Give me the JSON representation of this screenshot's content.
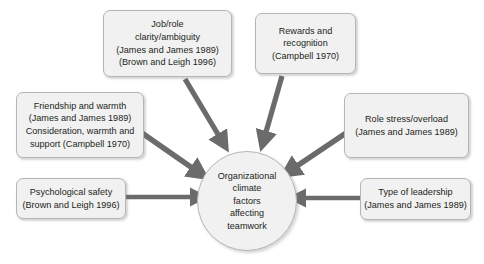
{
  "diagram": {
    "title": "Organizational climate factors affecting teamwork",
    "type": "radial-influence-diagram",
    "colors": {
      "box_fill": "#f1f1f1",
      "box_border": "#b5b5b5",
      "arrow": "#6b6b6b",
      "text": "#231f20",
      "background": "#ffffff"
    },
    "center": {
      "shape": "circle",
      "lines": [
        "Organizational",
        "climate",
        "factors",
        "affecting",
        "teamwork"
      ]
    },
    "nodes": [
      {
        "id": "job-role",
        "position": "top-left",
        "lines": [
          "Job/role",
          "clarity/ambiguity",
          "(James and James 1989)",
          "(Brown and Leigh 1996)"
        ]
      },
      {
        "id": "rewards",
        "position": "top-right",
        "lines": [
          "Rewards and",
          "recognition",
          "(Campbell 1970)"
        ]
      },
      {
        "id": "friendship",
        "position": "middle-left",
        "lines": [
          "Friendship and warmth",
          "(James and James 1989)",
          "Consideration, warmth and",
          "support (Campbell 1970)"
        ]
      },
      {
        "id": "role-stress",
        "position": "middle-right",
        "lines": [
          "Role stress/overload",
          "(James and James 1989)"
        ]
      },
      {
        "id": "psych-safety",
        "position": "bottom-left",
        "lines": [
          "Psychological safety",
          "(Brown and Leigh 1996)"
        ]
      },
      {
        "id": "leadership",
        "position": "bottom-right",
        "lines": [
          "Type of leadership",
          "(James and James 1989)"
        ]
      }
    ],
    "arrows": [
      {
        "id": "arrow-job-role-to-center",
        "from": "job-role",
        "to": "center",
        "direction": "down-right"
      },
      {
        "id": "arrow-rewards-to-center",
        "from": "rewards",
        "to": "center",
        "direction": "down-left"
      },
      {
        "id": "arrow-friendship-to-center",
        "from": "friendship",
        "to": "center",
        "direction": "down-right"
      },
      {
        "id": "arrow-role-stress-to-center",
        "from": "role-stress",
        "to": "center",
        "direction": "down-left"
      },
      {
        "id": "arrow-psych-safety-to-center",
        "from": "psych-safety",
        "to": "center",
        "direction": "right"
      },
      {
        "id": "arrow-leadership-to-center",
        "from": "leadership",
        "to": "center",
        "direction": "left"
      }
    ]
  }
}
